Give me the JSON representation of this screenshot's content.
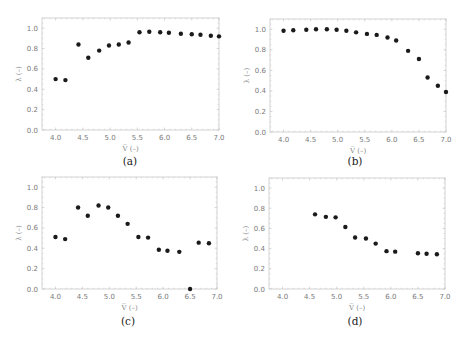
{
  "figure": {
    "panels_layout": "2x2"
  },
  "chart_data": [
    {
      "type": "scatter",
      "panel_label": "(a)",
      "xlabel": "V̅ (–)",
      "ylabel": "λ (–)",
      "xlim": [
        3.75,
        7.0
      ],
      "ylim": [
        0.0,
        1.1
      ],
      "xticks": [
        4.0,
        4.5,
        5.0,
        5.5,
        6.0,
        6.5,
        7.0
      ],
      "xtick_labels": [
        "4.0",
        "4.5",
        "5.0",
        "5.5",
        "6.0",
        "6.5",
        "7.0"
      ],
      "yticks": [
        0.0,
        0.2,
        0.4,
        0.6,
        0.8,
        1.0
      ],
      "ytick_labels": [
        "0.0",
        "0.2",
        "0.4",
        "0.6",
        "0.8",
        "1.0"
      ],
      "grid": false,
      "x": [
        4.0,
        4.18,
        4.42,
        4.6,
        4.8,
        4.98,
        5.16,
        5.34,
        5.54,
        5.72,
        5.92,
        6.08,
        6.3,
        6.5,
        6.66,
        6.85,
        7.0
      ],
      "y": [
        0.5,
        0.49,
        0.84,
        0.71,
        0.78,
        0.83,
        0.84,
        0.86,
        0.96,
        0.965,
        0.96,
        0.955,
        0.945,
        0.94,
        0.935,
        0.925,
        0.92
      ]
    },
    {
      "type": "scatter",
      "panel_label": "(b)",
      "xlabel": "V̅ (–)",
      "ylabel": "λ (–)",
      "xlim": [
        3.75,
        7.0
      ],
      "ylim": [
        0.0,
        1.1
      ],
      "xticks": [
        4.0,
        4.5,
        5.0,
        5.5,
        6.0,
        6.5,
        7.0
      ],
      "xtick_labels": [
        "4.0",
        "4.5",
        "5.0",
        "5.5",
        "6.0",
        "6.5",
        "7.0"
      ],
      "yticks": [
        0.0,
        0.2,
        0.4,
        0.6,
        0.8,
        1.0
      ],
      "ytick_labels": [
        "0.0",
        "0.2",
        "0.4",
        "0.6",
        "0.8",
        "1.0"
      ],
      "grid": false,
      "x": [
        4.0,
        4.18,
        4.42,
        4.6,
        4.8,
        4.98,
        5.16,
        5.34,
        5.54,
        5.72,
        5.92,
        6.08,
        6.3,
        6.5,
        6.66,
        6.85,
        7.0
      ],
      "y": [
        0.985,
        0.99,
        0.995,
        1.0,
        1.0,
        0.995,
        0.985,
        0.97,
        0.955,
        0.945,
        0.92,
        0.89,
        0.79,
        0.71,
        0.53,
        0.45,
        0.39
      ]
    },
    {
      "type": "scatter",
      "panel_label": "(c)",
      "xlabel": "V̅ (–)",
      "ylabel": "λ (–)",
      "xlim": [
        3.75,
        7.0
      ],
      "ylim": [
        0.0,
        1.1
      ],
      "xticks": [
        4.0,
        4.5,
        5.0,
        5.5,
        6.0,
        6.5,
        7.0
      ],
      "xtick_labels": [
        "4.0",
        "4.5",
        "5.0",
        "5.5",
        "6.0",
        "6.5",
        "7.0"
      ],
      "yticks": [
        0.0,
        0.2,
        0.4,
        0.6,
        0.8,
        1.0
      ],
      "ytick_labels": [
        "0.0",
        "0.2",
        "0.4",
        "0.6",
        "0.8",
        "1.0"
      ],
      "grid": false,
      "x": [
        4.0,
        4.18,
        4.42,
        4.6,
        4.8,
        4.98,
        5.16,
        5.34,
        5.54,
        5.72,
        5.92,
        6.08,
        6.3,
        6.5,
        6.66,
        6.85
      ],
      "y": [
        0.51,
        0.49,
        0.8,
        0.72,
        0.82,
        0.8,
        0.72,
        0.64,
        0.51,
        0.505,
        0.385,
        0.375,
        0.365,
        0.0,
        0.455,
        0.45
      ],
      "notes": "Point at x≈6.5 is drawn on the y=0 axis line; read as 0.0, but it may be a clipped marker for an out-of-range value — not determinable from the image."
    },
    {
      "type": "scatter",
      "panel_label": "(d)",
      "xlabel": "V̅ (–)",
      "ylabel": "λ (–)",
      "xlim": [
        3.75,
        7.0
      ],
      "ylim": [
        0.0,
        1.1
      ],
      "xticks": [
        4.0,
        4.5,
        5.0,
        5.5,
        6.0,
        6.5,
        7.0
      ],
      "xtick_labels": [
        "4.0",
        "4.5",
        "5.0",
        "5.5",
        "6.0",
        "6.5",
        "7.0"
      ],
      "yticks": [
        0.0,
        0.2,
        0.4,
        0.6,
        0.8,
        1.0
      ],
      "ytick_labels": [
        "0.0",
        "0.2",
        "0.4",
        "0.6",
        "0.8",
        "1.0"
      ],
      "grid": false,
      "x": [
        4.6,
        4.8,
        4.98,
        5.16,
        5.34,
        5.54,
        5.72,
        5.92,
        6.08,
        6.5,
        6.66,
        6.85
      ],
      "y": [
        0.74,
        0.715,
        0.71,
        0.615,
        0.51,
        0.5,
        0.45,
        0.375,
        0.37,
        0.355,
        0.35,
        0.345
      ]
    }
  ]
}
